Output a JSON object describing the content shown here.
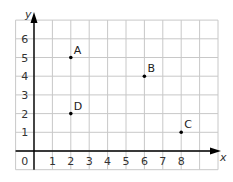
{
  "chart_data": {
    "type": "scatter",
    "title": "",
    "xlabel": "x",
    "ylabel": "y",
    "xlim": [
      0,
      10
    ],
    "ylim": [
      -1,
      7
    ],
    "grid": true,
    "x_ticks": [
      0,
      1,
      2,
      3,
      4,
      5,
      6,
      7,
      8
    ],
    "y_ticks": [
      1,
      2,
      3,
      4,
      5,
      6
    ],
    "points": [
      {
        "label": "A",
        "x": 2,
        "y": 5
      },
      {
        "label": "B",
        "x": 6,
        "y": 4
      },
      {
        "label": "C",
        "x": 8,
        "y": 1
      },
      {
        "label": "D",
        "x": 2,
        "y": 2
      }
    ]
  },
  "colors": {
    "grid": "#c8c8c8",
    "axis": "#000000",
    "point": "#000000",
    "text": "#333333"
  }
}
